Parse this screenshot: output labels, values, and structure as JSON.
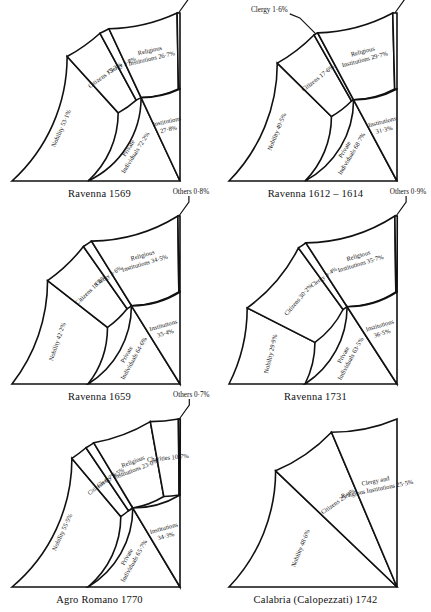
{
  "figure": {
    "background": "#ffffff",
    "ink": "#111111",
    "panel_count": 6
  },
  "chart_data": [
    {
      "type": "pie",
      "title": "Ravenna 1569",
      "orientation": "quarter-circle, center bottom-right, sweeping 0° (up) to 90° (left)",
      "rings": [
        "outer",
        "inner"
      ],
      "legend": "none",
      "grid": false,
      "series": [
        {
          "name": "outer",
          "ring": "outer",
          "labels": [
            "Nobility",
            "Citizens",
            "Clergy",
            "Religious Institutions",
            "Others"
          ],
          "values": [
            53.1,
            15.3,
            3.8,
            26.7,
            1.1
          ],
          "value_text": [
            "53·1%",
            "15·3%",
            "3·8%",
            "26·7%",
            "1·1%"
          ],
          "callouts": [
            "Others 1·1%"
          ]
        },
        {
          "name": "inner",
          "ring": "inner",
          "labels": [
            "Private Individuals",
            "Institutions"
          ],
          "values": [
            72.2,
            27.8
          ],
          "value_text": [
            "72·2%",
            "27·8%"
          ],
          "callouts": []
        }
      ]
    },
    {
      "type": "pie",
      "title": "Ravenna 1612 – 1614",
      "orientation": "quarter-circle, center bottom-right, sweeping 0° (up) to 90° (left)",
      "rings": [
        "outer",
        "inner"
      ],
      "legend": "none",
      "grid": false,
      "series": [
        {
          "name": "outer",
          "ring": "outer",
          "labels": [
            "Nobility",
            "Citizens",
            "Clergy",
            "Religious Institutions",
            "Others"
          ],
          "values": [
            49.5,
            17.6,
            1.6,
            29.7,
            1.6
          ],
          "value_text": [
            "49·5%",
            "17·6%",
            "1·6%",
            "29·7%",
            "1·6%"
          ],
          "callouts": [
            "Clergy 1·6%",
            "Others 1·6%"
          ]
        },
        {
          "name": "inner",
          "ring": "inner",
          "labels": [
            "Private Individuals",
            "Institutions"
          ],
          "values": [
            68.7,
            31.3
          ],
          "value_text": [
            "68·7%",
            "31·3%"
          ],
          "callouts": []
        }
      ]
    },
    {
      "type": "pie",
      "title": "Ravenna 1659",
      "orientation": "quarter-circle, center bottom-right, sweeping 0° (up) to 90° (left)",
      "rings": [
        "outer",
        "inner"
      ],
      "legend": "none",
      "grid": false,
      "series": [
        {
          "name": "outer",
          "ring": "outer",
          "labels": [
            "Nobility",
            "Citizens",
            "Clergy",
            "Religious Institutions",
            "Others"
          ],
          "values": [
            42.2,
            18.8,
            3.7,
            34.5,
            0.8
          ],
          "value_text": [
            "42·2%",
            "18·8%",
            "3·6%",
            "34·5%",
            "0·8%"
          ],
          "callouts": [
            "Others 0·8%"
          ]
        },
        {
          "name": "inner",
          "ring": "inner",
          "labels": [
            "Private Individuals",
            "Institutions"
          ],
          "values": [
            64.6,
            35.4
          ],
          "value_text": [
            "64·6%",
            "35·4%"
          ],
          "callouts": []
        }
      ]
    },
    {
      "type": "pie",
      "title": "Ravenna 1731",
      "orientation": "quarter-circle, center bottom-right, sweeping 0° (up) to 90° (left)",
      "rings": [
        "outer",
        "inner"
      ],
      "legend": "none",
      "grid": false,
      "series": [
        {
          "name": "outer",
          "ring": "outer",
          "labels": [
            "Nobility",
            "Citizens",
            "Clergy",
            "Religious Institutions",
            "Others"
          ],
          "values": [
            29.9,
            30.2,
            3.4,
            35.7,
            0.9
          ],
          "value_text": [
            "29·9%",
            "30·2%",
            "3·4%",
            "35·7%",
            "0·9%"
          ],
          "callouts": [
            "Others 0·9%"
          ]
        },
        {
          "name": "inner",
          "ring": "inner",
          "labels": [
            "Private Individuals",
            "Institutions"
          ],
          "values": [
            63.5,
            36.5
          ],
          "value_text": [
            "63·5%",
            "36·5%"
          ],
          "callouts": []
        }
      ]
    },
    {
      "type": "pie",
      "title": "Agro Romano 1770",
      "orientation": "quarter-circle, center bottom-right, sweeping 0° (up) to 90° (left)",
      "rings": [
        "outer",
        "inner"
      ],
      "legend": "none",
      "grid": false,
      "series": [
        {
          "name": "outer",
          "ring": "outer",
          "labels": [
            "Nobility",
            "Citizens",
            "Clergy",
            "Religious Institutions",
            "Charities",
            "Others"
          ],
          "values": [
            55.5,
            6.7,
            3.5,
            23.0,
            10.7,
            0.7
          ],
          "value_text": [
            "55·5%",
            "6·7%",
            "3·5%",
            "23·0%",
            "10·7%",
            "0·7%"
          ],
          "callouts": [
            "Others 0·7%"
          ]
        },
        {
          "name": "inner",
          "ring": "inner",
          "labels": [
            "Private Individuals",
            "Institutions"
          ],
          "values": [
            65.7,
            34.3
          ],
          "value_text": [
            "65·7%",
            "34·3%"
          ],
          "callouts": []
        }
      ]
    },
    {
      "type": "pie",
      "title": "Calabria (Calopezzati) 1742",
      "orientation": "quarter-circle, center bottom-right, sweeping 0° (up) to 90° (left)",
      "rings": [
        "outer"
      ],
      "legend": "none",
      "grid": false,
      "series": [
        {
          "name": "outer",
          "ring": "outer",
          "labels": [
            "Nobility",
            "Citizens",
            "Clergy and Religious Institutions"
          ],
          "values": [
            48.6,
            25.9,
            25.5
          ],
          "value_text": [
            "48·6%",
            "25·9%",
            "25·5%"
          ],
          "callouts": []
        }
      ]
    }
  ],
  "panels": [
    {
      "id": "ravenna-1569",
      "caption": "Ravenna 1569",
      "outer": [
        {
          "name": "Nobility",
          "text": "Nobility 53·1%",
          "pct": 53.1,
          "mode": "radial-wide"
        },
        {
          "name": "Citizens",
          "text": "Citizens 15·3%",
          "pct": 15.3,
          "mode": "radial"
        },
        {
          "name": "Clergy",
          "text": "Clergy 3·8%",
          "pct": 3.8,
          "mode": "radial-thin"
        },
        {
          "name": "Religious Institutions",
          "text": "Religious\nInstitutions 26·7%",
          "pct": 26.7,
          "mode": "radial-two"
        },
        {
          "name": "Others",
          "text": "",
          "pct": 1.1,
          "mode": "callout"
        }
      ],
      "inner": [
        {
          "name": "Private Individuals",
          "text": "Private\nIndividuals 72·2%",
          "pct": 72.2,
          "mode": "radial-two"
        },
        {
          "name": "Institutions",
          "text": "Institutions\n27·8%",
          "pct": 27.8,
          "mode": "radial-two"
        }
      ],
      "callouts": [
        {
          "name": "others-callout",
          "text": "Others 1·1%"
        }
      ]
    },
    {
      "id": "ravenna-1612-1614",
      "caption": "Ravenna 1612 – 1614",
      "outer": [
        {
          "name": "Nobility",
          "text": "Nobility 49·5%",
          "pct": 49.5,
          "mode": "radial-wide"
        },
        {
          "name": "Citizens",
          "text": "Citizens 17·6%",
          "pct": 17.6,
          "mode": "radial"
        },
        {
          "name": "Clergy",
          "text": "",
          "pct": 1.6,
          "mode": "callout"
        },
        {
          "name": "Religious Institutions",
          "text": "Religious\nInstitutions 29·7%",
          "pct": 29.7,
          "mode": "radial-two"
        },
        {
          "name": "Others",
          "text": "",
          "pct": 1.6,
          "mode": "callout"
        }
      ],
      "inner": [
        {
          "name": "Private Individuals",
          "text": "Private\nIndividuals 68·7%",
          "pct": 68.7,
          "mode": "radial-two"
        },
        {
          "name": "Institutions",
          "text": "Institutions\n31·3%",
          "pct": 31.3,
          "mode": "radial-two"
        }
      ],
      "callouts": [
        {
          "name": "clergy-callout",
          "text": "Clergy 1·6%"
        },
        {
          "name": "others-callout",
          "text": "Others 1·6%"
        }
      ]
    },
    {
      "id": "ravenna-1659",
      "caption": "Ravenna 1659",
      "outer": [
        {
          "name": "Nobility",
          "text": "Nobility 42·2%",
          "pct": 42.2,
          "mode": "radial-wide"
        },
        {
          "name": "Citizens",
          "text": "Citizens 18·8%",
          "pct": 18.8,
          "mode": "radial"
        },
        {
          "name": "Clergy",
          "text": "Clergy 3·6%",
          "pct": 3.7,
          "mode": "radial-thin"
        },
        {
          "name": "Religious Institutions",
          "text": "Religious\nInstitutions 34·5%",
          "pct": 34.5,
          "mode": "radial-two"
        },
        {
          "name": "Others",
          "text": "",
          "pct": 0.8,
          "mode": "callout"
        }
      ],
      "inner": [
        {
          "name": "Private Individuals",
          "text": "Private\nIndividuals 64·6%",
          "pct": 64.6,
          "mode": "radial-two"
        },
        {
          "name": "Institutions",
          "text": "Institutions\n35·4%",
          "pct": 35.4,
          "mode": "radial-two"
        }
      ],
      "callouts": [
        {
          "name": "others-callout",
          "text": "Others 0·8%"
        }
      ]
    },
    {
      "id": "ravenna-1731",
      "caption": "Ravenna 1731",
      "outer": [
        {
          "name": "Nobility",
          "text": "Nobility 29·9%",
          "pct": 29.9,
          "mode": "radial-wide"
        },
        {
          "name": "Citizens",
          "text": "Citizens 30·2%",
          "pct": 30.2,
          "mode": "radial"
        },
        {
          "name": "Clergy",
          "text": "Clergy 3·4%",
          "pct": 3.4,
          "mode": "radial-thin"
        },
        {
          "name": "Religious Institutions",
          "text": "Religious\nInstitutions 35·7%",
          "pct": 35.7,
          "mode": "radial-two"
        },
        {
          "name": "Others",
          "text": "",
          "pct": 0.9,
          "mode": "callout"
        }
      ],
      "inner": [
        {
          "name": "Private Individuals",
          "text": "Private\nIndividuals 63·5%",
          "pct": 63.5,
          "mode": "radial-two"
        },
        {
          "name": "Institutions",
          "text": "Institutions\n36·5%",
          "pct": 36.5,
          "mode": "radial-two"
        }
      ],
      "callouts": [
        {
          "name": "others-callout",
          "text": "Others 0·9%"
        }
      ]
    },
    {
      "id": "agro-romano-1770",
      "caption": "Agro Romano 1770",
      "outer": [
        {
          "name": "Nobility",
          "text": "Nobility 55·5%",
          "pct": 55.5,
          "mode": "radial-wide"
        },
        {
          "name": "Citizens",
          "text": "Citizens 6·7%",
          "pct": 6.7,
          "mode": "radial-thin"
        },
        {
          "name": "Clergy",
          "text": "Clergy 3·5%",
          "pct": 3.5,
          "mode": "radial-thin"
        },
        {
          "name": "Religious Institutions",
          "text": "Religious\nInstitutions 23·0%",
          "pct": 23.0,
          "mode": "radial-two"
        },
        {
          "name": "Charities",
          "text": "Charities 10·7%",
          "pct": 10.7,
          "mode": "radial"
        },
        {
          "name": "Others",
          "text": "",
          "pct": 0.7,
          "mode": "callout"
        }
      ],
      "inner": [
        {
          "name": "Private Individuals",
          "text": "Private\nIndividuals 65·7%",
          "pct": 65.7,
          "mode": "radial-two"
        },
        {
          "name": "Institutions",
          "text": "Institutions\n34·3%",
          "pct": 34.3,
          "mode": "radial-two"
        }
      ],
      "callouts": [
        {
          "name": "others-callout",
          "text": "Others 0·7%"
        }
      ]
    },
    {
      "id": "calabria-calopezzati-1742",
      "caption": "Calabria (Calopezzati) 1742",
      "outer": [
        {
          "name": "Nobility",
          "text": "Nobility 48·6%",
          "pct": 48.6,
          "mode": "radial-wide"
        },
        {
          "name": "Citizens",
          "text": "Citizens 25·9%",
          "pct": 25.9,
          "mode": "radial"
        },
        {
          "name": "Clergy and Religious Institutions",
          "text": "Clergy and\nReligious Institutions 25·5%",
          "pct": 25.5,
          "mode": "radial-two"
        }
      ],
      "inner": [],
      "callouts": []
    }
  ]
}
